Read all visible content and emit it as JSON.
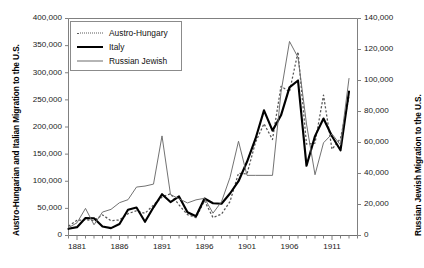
{
  "chart_data": {
    "type": "line",
    "title": "",
    "xlabel": "",
    "ylabel": "Austro-Hungarian and Italian Migration to the U.S.",
    "y2label": "Russian Jewish Migration to the U.S.",
    "xlim": [
      1880,
      1914
    ],
    "ylim": [
      0,
      400000
    ],
    "y2lim": [
      0,
      140000
    ],
    "grid": false,
    "legend_position": "top-left",
    "xticks": [
      1881,
      1886,
      1891,
      1896,
      1901,
      1906,
      1911
    ],
    "xtick_labels": [
      "1881",
      "1886",
      "1891",
      "1896",
      "1901",
      "1906",
      "1911"
    ],
    "xticks_minor_every": 1,
    "yticks": [
      0,
      50000,
      100000,
      150000,
      200000,
      250000,
      300000,
      350000,
      400000
    ],
    "ytick_labels": [
      "0",
      "50,000",
      "100,000",
      "150,000",
      "200,000",
      "250,000",
      "300,000",
      "350,000",
      "400,000"
    ],
    "y2ticks": [
      0,
      20000,
      40000,
      60000,
      80000,
      100000,
      120000,
      140000
    ],
    "y2tick_labels": [
      "0",
      "20,000",
      "40,000",
      "60,000",
      "80,000",
      "100,000",
      "120,000",
      "140,000"
    ],
    "x": [
      1880,
      1881,
      1882,
      1883,
      1884,
      1885,
      1886,
      1887,
      1888,
      1889,
      1890,
      1891,
      1892,
      1893,
      1894,
      1895,
      1896,
      1897,
      1898,
      1899,
      1900,
      1901,
      1902,
      1903,
      1904,
      1905,
      1906,
      1907,
      1908,
      1909,
      1910,
      1911,
      1912,
      1913
    ],
    "series": [
      {
        "name": "Austro-Hungary",
        "axis": "left",
        "style": "dotted",
        "color": "#555555",
        "values": [
          17267,
          27935,
          29150,
          27600,
          37900,
          27300,
          28700,
          40300,
          45600,
          40800,
          56200,
          71000,
          76900,
          56300,
          38400,
          33000,
          64000,
          33000,
          39500,
          62500,
          114800,
          113400,
          171900,
          206000,
          177000,
          275000,
          265100,
          338500,
          168500,
          170200,
          258700,
          159000,
          178900,
          254800
        ]
      },
      {
        "name": "Italy",
        "axis": "left",
        "style": "thick-solid",
        "color": "#000000",
        "values": [
          12354,
          15400,
          32200,
          31800,
          16500,
          13600,
          21300,
          47600,
          51600,
          25300,
          52000,
          76100,
          61600,
          72100,
          42900,
          35400,
          68100,
          59400,
          58600,
          77400,
          100100,
          135900,
          178400,
          230600,
          193300,
          221500,
          273100,
          285700,
          128500,
          183200,
          215500,
          182900,
          157100,
          265500
        ]
      },
      {
        "name": "Russian Jewish",
        "axis": "right",
        "style": "thin-solid",
        "color": "#6a6a6a",
        "values": [
          5014,
          8194,
          17497,
          6907,
          15122,
          16862,
          21173,
          23103,
          31256,
          31889,
          33147,
          64253,
          26400,
          23700,
          21000,
          23000,
          24000,
          14400,
          21800,
          37400,
          60800,
          38800,
          38800,
          38800,
          38800,
          92400,
          125200,
          114900,
          71900,
          39200,
          59800,
          65500,
          58400,
          101300
        ]
      }
    ]
  },
  "legend": {
    "items": [
      {
        "label": "Austro-Hungary",
        "style": "dotted"
      },
      {
        "label": "Italy",
        "style": "thick-solid"
      },
      {
        "label": "Russian Jewish",
        "style": "thin-solid"
      }
    ]
  }
}
